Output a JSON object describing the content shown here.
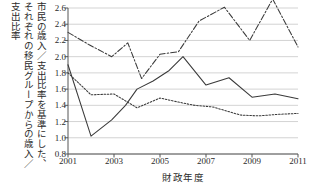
{
  "chart_data": {
    "type": "line",
    "title": "",
    "ylabel": "市民の歳入／支出比率を基準にした、それぞれの移民グループからの歳入／支出比率",
    "ylabel_columns": [
      "市民の歳入／支出比率を基準にした、",
      "それぞれの移民グループからの歳入／",
      "支出比率"
    ],
    "xlabel": "財政年度",
    "x": [
      2001,
      2002,
      2003,
      2004,
      2005,
      2006,
      2007,
      2008,
      2009,
      2010,
      2011
    ],
    "xlim": [
      2001,
      2011
    ],
    "ylim": [
      0.8,
      2.6
    ],
    "xticks": [
      2001,
      2003,
      2005,
      2007,
      2009,
      2011
    ],
    "xtick_labels": [
      "2001",
      "2003",
      "2005",
      "2007",
      "2009",
      "2011"
    ],
    "yticks": [
      0.8,
      1.0,
      1.2,
      1.4,
      1.6,
      1.8,
      2.0,
      2.2,
      2.4,
      2.6
    ],
    "ytick_labels": [
      "0.8",
      "1.0",
      "1.2",
      "1.4",
      "1.6",
      "1.8",
      "2.0",
      "2.2",
      "2.4",
      "2.6"
    ],
    "grid": true,
    "grid_axis": "y",
    "legend": false,
    "legend_position": "none",
    "line_color": "#3a3a3a",
    "grid_color": "#c8c8c8",
    "axis_color": "#555555",
    "background": "#ffffff",
    "series": [
      {
        "name": "dash-dot-series",
        "style": "dashdot",
        "values": [
          2.3,
          2.15,
          2.0,
          2.17,
          1.73,
          2.03,
          2.06,
          2.44,
          2.61,
          2.2,
          2.71,
          2.12
        ],
        "x_values": [
          2001,
          2001.9,
          2002.9,
          2003.6,
          2004.2,
          2005.0,
          2005.8,
          2006.7,
          2007.8,
          2008.9,
          2009.9,
          2011
        ]
      },
      {
        "name": "solid-series",
        "style": "solid",
        "values": [
          1.9,
          1.02,
          1.22,
          1.4,
          1.6,
          1.7,
          1.83,
          2.0,
          1.65,
          1.74,
          1.5,
          1.54,
          1.48
        ],
        "x_values": [
          2001,
          2002,
          2002.9,
          2003.5,
          2004,
          2004.7,
          2005.4,
          2006,
          2007,
          2008,
          2009,
          2010,
          2011
        ]
      },
      {
        "name": "dotted-series",
        "style": "dotted",
        "values": [
          1.8,
          1.53,
          1.54,
          1.37,
          1.49,
          1.44,
          1.4,
          1.38,
          1.28,
          1.27,
          1.29,
          1.3
        ],
        "x_values": [
          2001,
          2002,
          2003,
          2004,
          2005,
          2005.8,
          2006.5,
          2007.3,
          2008.5,
          2009.3,
          2010.2,
          2011
        ]
      }
    ]
  }
}
